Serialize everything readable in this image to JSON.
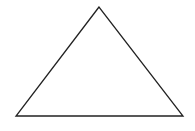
{
  "diagram": {
    "shape": "triangle",
    "stroke_color": "#222222",
    "fill_color": "#ffffff",
    "vertices": {
      "apex": [
        99,
        7
      ],
      "bottom_left": [
        16,
        116
      ],
      "bottom_right": [
        183,
        116
      ]
    }
  }
}
